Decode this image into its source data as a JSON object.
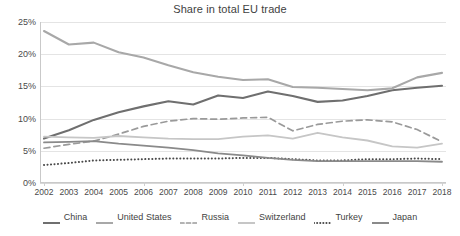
{
  "chart_data": {
    "type": "line",
    "title": "Share in total EU trade",
    "xlabel": "",
    "ylabel": "",
    "ylim": [
      0,
      25
    ],
    "yticks": [
      0,
      5,
      10,
      15,
      20,
      25
    ],
    "ytick_labels": [
      "0%",
      "5%",
      "10%",
      "15%",
      "20%",
      "25%"
    ],
    "grid": true,
    "legend_position": "bottom",
    "categories": [
      2002,
      2003,
      2004,
      2005,
      2006,
      2007,
      2008,
      2009,
      2010,
      2011,
      2012,
      2013,
      2014,
      2015,
      2016,
      2017,
      2018
    ],
    "x_tick_labels": [
      "2002",
      "2003",
      "2004",
      "2005",
      "2006",
      "2007",
      "2008",
      "2009",
      "2010",
      "2011",
      "2012",
      "2013",
      "2014",
      "2015",
      "2016",
      "2017",
      "2018"
    ],
    "series": [
      {
        "name": "China",
        "color": "#6f6f6f",
        "style": "solid",
        "width": 2.1,
        "values": [
          6.9,
          8.2,
          9.8,
          11.0,
          11.9,
          12.7,
          12.2,
          13.6,
          13.2,
          14.2,
          13.5,
          12.6,
          12.8,
          13.5,
          14.4,
          14.8,
          15.1
        ]
      },
      {
        "name": "United States",
        "color": "#a8a8a8",
        "style": "solid",
        "width": 2.1,
        "values": [
          23.6,
          21.5,
          21.8,
          20.3,
          19.5,
          18.3,
          17.2,
          16.5,
          16.0,
          16.1,
          14.9,
          14.8,
          14.6,
          14.4,
          14.7,
          16.4,
          17.1
        ]
      },
      {
        "name": "Russia",
        "color": "#9a9a9a",
        "style": "dashed",
        "width": 1.7,
        "values": [
          5.4,
          6.0,
          6.5,
          7.6,
          8.8,
          9.6,
          10.0,
          9.9,
          10.1,
          10.2,
          8.1,
          9.1,
          9.6,
          9.8,
          9.5,
          8.3,
          6.4
        ]
      },
      {
        "name": "Switzerland",
        "color": "#c6c6c6",
        "style": "solid",
        "width": 1.8,
        "values": [
          7.2,
          7.1,
          7.0,
          7.3,
          7.1,
          6.9,
          6.8,
          6.8,
          7.2,
          7.4,
          6.9,
          7.8,
          7.1,
          6.6,
          5.7,
          5.5,
          6.1
        ]
      },
      {
        "name": "Turkey",
        "color": "#4a4a4a",
        "style": "dotted",
        "width": 2.0,
        "values": [
          2.8,
          3.1,
          3.5,
          3.6,
          3.7,
          3.8,
          3.8,
          3.8,
          3.9,
          3.9,
          3.7,
          3.5,
          3.5,
          3.7,
          3.7,
          3.8,
          3.7
        ]
      },
      {
        "name": "Japan",
        "color": "#8a8a8a",
        "style": "solid",
        "width": 1.8,
        "values": [
          6.3,
          6.4,
          6.5,
          6.1,
          5.8,
          5.5,
          5.1,
          4.6,
          4.3,
          3.9,
          3.6,
          3.4,
          3.4,
          3.4,
          3.4,
          3.4,
          3.3
        ]
      }
    ]
  },
  "legend": {
    "items": [
      {
        "label": "China"
      },
      {
        "label": "United States"
      },
      {
        "label": "Russia"
      },
      {
        "label": "Switzerland"
      },
      {
        "label": "Turkey"
      },
      {
        "label": "Japan"
      }
    ]
  }
}
